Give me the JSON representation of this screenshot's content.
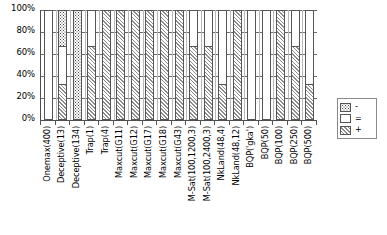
{
  "chart_data": {
    "type": "bar",
    "subtype": "stacked-percentage",
    "title": "",
    "xlabel": "",
    "ylabel": "",
    "ylim": [
      0,
      100
    ],
    "y_ticks": [
      0,
      20,
      40,
      60,
      80,
      100
    ],
    "y_tick_labels": [
      "0%",
      "20%",
      "40%",
      "60%",
      "80%",
      "100%"
    ],
    "grid": true,
    "legend_position": "right",
    "categories": [
      "Onemax(400)",
      "Deceptive(13)",
      "Deceptive(134)",
      "Trap(1)",
      "Trap(4)",
      "Maxcut(G11)",
      "Maxcut(G12)",
      "Maxcut(G17)",
      "Maxcut(G18)",
      "Maxcut(G43)",
      "M-Sat(100,1200,3)",
      "M-Sat(100,2400,3)",
      "NkLand(48,4)",
      "NkLand(48,12)",
      "BQP('gka')",
      "BQP(50)",
      "BQP(100)",
      "BQP(250)",
      "BQP(500)"
    ],
    "series": [
      {
        "name": "-",
        "pattern": "dotted",
        "values": [
          0,
          33,
          100,
          0,
          0,
          0,
          0,
          0,
          0,
          0,
          0,
          0,
          0,
          0,
          0,
          0,
          0,
          0,
          0
        ]
      },
      {
        "name": "=",
        "pattern": "blank",
        "values": [
          100,
          34,
          0,
          33,
          0,
          0,
          0,
          0,
          0,
          0,
          33,
          33,
          67,
          0,
          100,
          100,
          0,
          33,
          67
        ]
      },
      {
        "name": "+",
        "pattern": "diagonal",
        "values": [
          0,
          33,
          0,
          67,
          100,
          100,
          100,
          100,
          100,
          100,
          67,
          67,
          33,
          100,
          0,
          0,
          100,
          67,
          33
        ]
      }
    ]
  },
  "legend": {
    "entries": [
      {
        "label": "-",
        "pattern": "dotted"
      },
      {
        "label": "=",
        "pattern": "blank"
      },
      {
        "label": "+",
        "pattern": "diagonal"
      }
    ]
  }
}
